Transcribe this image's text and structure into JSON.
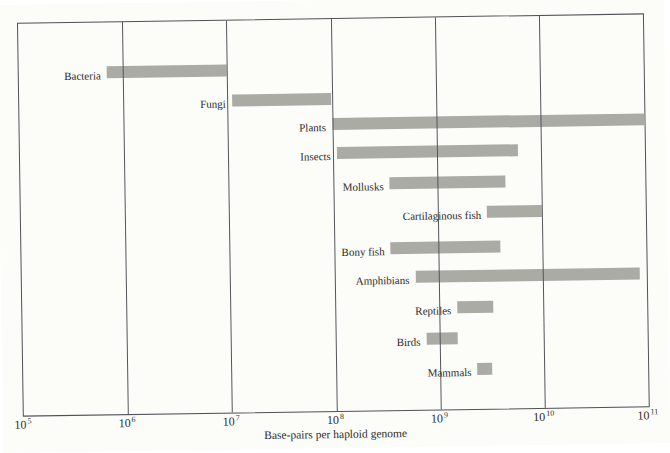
{
  "figure": {
    "background": "#fcfcf9",
    "frame_color": "#515257",
    "grid_color": "#55565a",
    "bar_color": "#a9aba4",
    "text_color": "#2e2c29"
  },
  "chart_data": {
    "type": "bar",
    "subtype": "horizontal-range",
    "scale": "log10",
    "title": "",
    "xlabel": "Base-pairs per haploid genome",
    "ylabel": "",
    "xlim": [
      100000.0,
      100000000000.0
    ],
    "grid": "vertical-gridlines-at-each-decade",
    "legend": "none",
    "x_tick_exponents": [
      5,
      6,
      7,
      8,
      9,
      10,
      11
    ],
    "x_tick_labels": [
      "10⁵",
      "10⁶",
      "10⁷",
      "10⁸",
      "10⁹",
      "10¹⁰",
      "10¹¹"
    ],
    "categories": [
      "Bacteria",
      "Fungi",
      "Plants",
      "Insects",
      "Mollusks",
      "Cartilaginous fish",
      "Bony fish",
      "Amphibians",
      "Reptiles",
      "Birds",
      "Mammals"
    ],
    "ranges": [
      {
        "label": "Bacteria",
        "min": 700000.0,
        "max": 10000000.0
      },
      {
        "label": "Fungi",
        "min": 11000000.0,
        "max": 100000000.0
      },
      {
        "label": "Plants",
        "min": 100000000.0,
        "max": 100000000000.0
      },
      {
        "label": "Insects",
        "min": 110000000.0,
        "max": 6000000000.0
      },
      {
        "label": "Mollusks",
        "min": 350000000.0,
        "max": 4500000000.0
      },
      {
        "label": "Cartilaginous fish",
        "min": 3000000000.0,
        "max": 10000000000.0
      },
      {
        "label": "Bony fish",
        "min": 350000000.0,
        "max": 4000000000.0
      },
      {
        "label": "Amphibians",
        "min": 600000000.0,
        "max": 85000000000.0
      },
      {
        "label": "Reptiles",
        "min": 1500000000.0,
        "max": 3300000000.0
      },
      {
        "label": "Birds",
        "min": 750000000.0,
        "max": 1500000000.0
      },
      {
        "label": "Mammals",
        "min": 2300000000.0,
        "max": 3200000000.0
      }
    ]
  }
}
